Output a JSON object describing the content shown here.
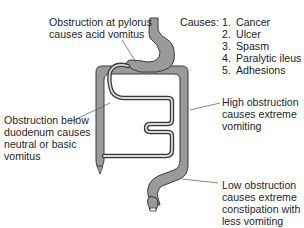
{
  "diagram": {
    "colors": {
      "organ_fill": "#9a9a9a",
      "organ_stroke": "#3a3a3a",
      "lumen": "#ffffff",
      "leader_line": "#555555",
      "text": "#1f1f1f"
    },
    "labels": {
      "pylorus": "Obstruction at pylorus\ncauses acid vomitus",
      "duodenum": "Obstruction below\nduodenum causes\nneutral or basic\nvomitus",
      "high": "High obstruction\ncauses extreme\nvomiting",
      "low": "Low obstruction\ncauses extreme\nconstipation with\nless vomiting"
    },
    "causes": {
      "heading": "Causes:",
      "items": [
        {
          "num": "1.",
          "label": "Cancer"
        },
        {
          "num": "2.",
          "label": "Ulcer"
        },
        {
          "num": "3.",
          "label": "Spasm"
        },
        {
          "num": "4.",
          "label": "Paralytic ileus"
        },
        {
          "num": "5.",
          "label": "Adhesions"
        }
      ]
    },
    "structures": [
      "esophagus",
      "stomach",
      "pylorus",
      "duodenum",
      "small-intestine",
      "ascending-colon",
      "transverse-colon",
      "descending-colon",
      "sigmoid-colon",
      "appendix",
      "rectum"
    ]
  }
}
